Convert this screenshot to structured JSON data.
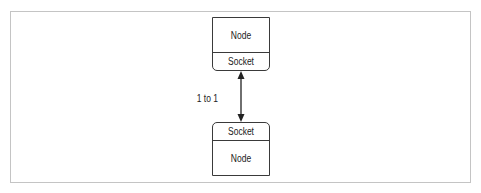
{
  "diagram": {
    "top_box": {
      "title": "Node",
      "socket": "Socket"
    },
    "bottom_box": {
      "socket": "Socket",
      "title": "Node"
    },
    "connector": {
      "label": "1 to 1",
      "type": "bidirectional-arrow"
    },
    "colors": {
      "stroke": "#3a3a3a",
      "frame": "#c4c4c4",
      "text": "#222222"
    }
  }
}
